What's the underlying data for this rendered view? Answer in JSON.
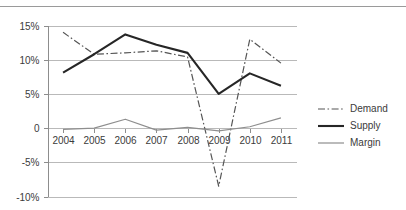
{
  "chart_data": {
    "type": "line",
    "title": "",
    "xlabel": "",
    "ylabel": "",
    "categories": [
      "2004",
      "2005",
      "2006",
      "2007",
      "2008",
      "2009",
      "2010",
      "2011"
    ],
    "ylim": [
      -10,
      15
    ],
    "yticks": [
      15,
      10,
      5,
      0,
      -5,
      -10
    ],
    "ytick_labels": [
      "15%",
      "10%",
      "5%",
      "0",
      "-5%",
      "-10%"
    ],
    "grid": true,
    "legend_position": "right",
    "series": [
      {
        "name": "Demand",
        "style": "dash-dot",
        "color": "#555555",
        "values": [
          14.0,
          10.8,
          11.0,
          11.3,
          10.4,
          -8.5,
          13.0,
          9.5
        ]
      },
      {
        "name": "Supply",
        "style": "solid-thick",
        "color": "#262626",
        "values": [
          8.1,
          10.8,
          13.7,
          12.2,
          11.0,
          5.0,
          8.0,
          6.2
        ]
      },
      {
        "name": "Margin",
        "style": "solid-thin",
        "color": "#8e8e8e",
        "values": [
          -0.2,
          0.0,
          1.3,
          -0.3,
          0.1,
          -0.4,
          0.2,
          1.5
        ]
      }
    ]
  },
  "legend": {
    "items": [
      {
        "label": "Demand"
      },
      {
        "label": "Supply"
      },
      {
        "label": "Margin"
      }
    ]
  }
}
